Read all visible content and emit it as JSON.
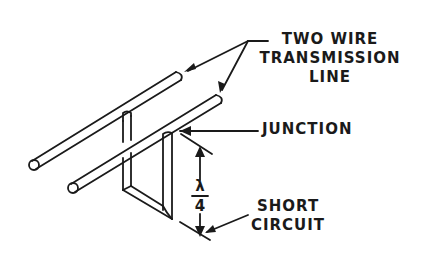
{
  "diagram": {
    "type": "technical illustration",
    "labels": {
      "transmission_line": [
        "TWO WIRE",
        "TRANSMISSION",
        "LINE"
      ],
      "junction": "JUNCTION",
      "short_circuit": [
        "SHORT",
        "CIRCUIT"
      ],
      "length_numerator": "λ",
      "length_denominator": "4"
    },
    "colors": {
      "line": "#1a1a1a",
      "background": "#ffffff"
    }
  }
}
